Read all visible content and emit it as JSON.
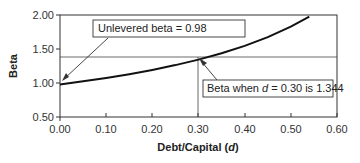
{
  "chart_data": {
    "type": "line",
    "title": "",
    "xlabel": "Debt/Capital (d)",
    "xlabel_main": "Debt/Capital (",
    "xlabel_var": "d",
    "xlabel_end": ")",
    "ylabel": "Beta",
    "xlim": [
      0.0,
      0.6
    ],
    "ylim": [
      0.5,
      2.0
    ],
    "x_ticks": [
      "0.00",
      "0.10",
      "0.20",
      "0.30",
      "0.40",
      "0.50",
      "0.60"
    ],
    "y_ticks": [
      "0.50",
      "1.00",
      "1.50",
      "2.00"
    ],
    "grid": false,
    "series": [
      {
        "name": "Levered beta",
        "x": [
          0.0,
          0.05,
          0.1,
          0.15,
          0.2,
          0.25,
          0.3,
          0.35,
          0.4,
          0.45,
          0.5,
          0.54
        ],
        "values": [
          0.98,
          1.025,
          1.074,
          1.13,
          1.192,
          1.263,
          1.344,
          1.437,
          1.546,
          1.675,
          1.829,
          1.977
        ]
      }
    ],
    "reference_lines": [
      {
        "type": "horizontal",
        "y": 1.344,
        "x_range": [
          0.0,
          0.6
        ]
      },
      {
        "type": "vertical",
        "x": 0.3,
        "y_range": [
          0.5,
          1.344
        ]
      }
    ],
    "annotations": [
      {
        "text": "Unlevered beta = 0.98",
        "points_to": {
          "x": 0.0,
          "y": 0.98
        }
      },
      {
        "text_pre": "Beta when ",
        "text_var": "d",
        "text_post": " = 0.30 is 1.344",
        "text": "Beta when d = 0.30 is 1.344",
        "points_to": {
          "x": 0.3,
          "y": 1.344
        }
      }
    ]
  }
}
